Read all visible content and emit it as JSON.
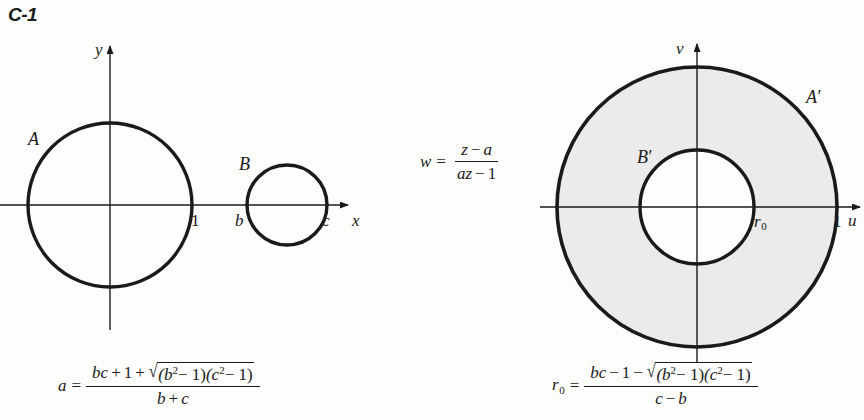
{
  "figure": {
    "label": "C-1",
    "width": 864,
    "height": 420,
    "background_color": "#fdfdfc",
    "ink_color": "#1a1a1a",
    "shade_color": "#ebebeb"
  },
  "left_panel": {
    "axes": {
      "x_label": "x",
      "y_label": "y",
      "origin": {
        "x": 110,
        "y": 205
      }
    },
    "circles": [
      {
        "name": "A",
        "label": "A",
        "center": {
          "x": 110,
          "y": 205
        },
        "radius": 82,
        "filled": false
      },
      {
        "name": "B",
        "label": "B",
        "center": {
          "x": 287,
          "y": 205
        },
        "radius": 40,
        "filled": false
      }
    ],
    "tick_labels": [
      {
        "name": "unit-point",
        "text": "1",
        "x": 191,
        "y": 222
      },
      {
        "name": "b-point",
        "text": "b",
        "x": 238,
        "y": 222
      },
      {
        "name": "c-point",
        "text": "c",
        "x": 325,
        "y": 222
      }
    ],
    "formula": {
      "lhs": "a",
      "equals": "=",
      "numerator": {
        "term1": "bc",
        "op1": "+",
        "term2": "1",
        "op2": "+",
        "radical": "√",
        "radicand_left": "(b",
        "radicand_left_exp": "2",
        "radicand_left_rest": "− 1)",
        "radicand_right": "(c",
        "radicand_right_exp": "2",
        "radicand_right_rest": "− 1)"
      },
      "denominator": {
        "term1": "b",
        "op": "+",
        "term2": "c"
      },
      "plain_text": "a = (bc + 1 + √((b² − 1)(c² − 1))) / (b + c)"
    }
  },
  "transform": {
    "lhs": "w",
    "equals": "=",
    "numerator": {
      "term1": "z",
      "op": "−",
      "term2": "a"
    },
    "denominator": {
      "term1": "az",
      "op": "−",
      "term2": "1"
    },
    "plain_text": "w = (z − a) / (az − 1)"
  },
  "right_panel": {
    "axes": {
      "x_label": "u",
      "y_label": "v",
      "origin": {
        "x": 697,
        "y": 207
      }
    },
    "circles": [
      {
        "name": "A-prime",
        "label": "A",
        "prime": "′",
        "center": {
          "x": 697,
          "y": 207
        },
        "radius": 140,
        "filled": false
      },
      {
        "name": "B-prime",
        "label": "B",
        "prime": "′",
        "center": {
          "x": 697,
          "y": 207
        },
        "radius": 57,
        "filled": false
      }
    ],
    "shaded_region": "annulus between B′ and A′",
    "tick_labels": [
      {
        "name": "r0-point",
        "text": "r",
        "sub": "0",
        "x": 756,
        "y": 224
      },
      {
        "name": "unit-point",
        "text": "1",
        "x": 836,
        "y": 224
      }
    ],
    "formula": {
      "lhs": "r",
      "lhs_sub": "0",
      "equals": "=",
      "numerator": {
        "term1": "bc",
        "op1": "−",
        "term2": "1",
        "op2": "−",
        "radical": "√",
        "radicand_left": "(b",
        "radicand_left_exp": "2",
        "radicand_left_rest": "− 1)",
        "radicand_right": "(c",
        "radicand_right_exp": "2",
        "radicand_right_rest": "− 1)"
      },
      "denominator": {
        "term1": "c",
        "op": "−",
        "term2": "b"
      },
      "plain_text": "r₀ = (bc − 1 − √((b² − 1)(c² − 1))) / (c − b)"
    }
  }
}
